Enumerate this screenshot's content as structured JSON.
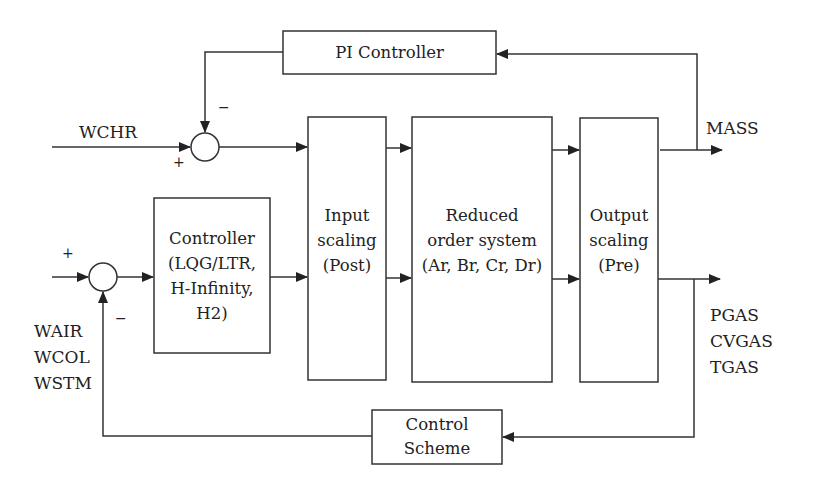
{
  "diagram": {
    "type": "control-block-diagram",
    "blocks": {
      "pi_controller": {
        "label": "PI Controller"
      },
      "controller": {
        "lines": [
          "Controller",
          "(LQG/LTR,",
          "H-Infinity,",
          "H2)"
        ]
      },
      "input_scaling": {
        "lines": [
          "Input",
          "scaling",
          "(Post)"
        ]
      },
      "reduced_order": {
        "lines": [
          "Reduced",
          "order system",
          "(Ar, Br, Cr, Dr)"
        ]
      },
      "output_scaling": {
        "lines": [
          "Output",
          "scaling",
          "(Pre)"
        ]
      },
      "control_scheme": {
        "lines": [
          "Control",
          "Scheme"
        ]
      }
    },
    "signals": {
      "top_input": "WCHR",
      "top_output": "MASS",
      "bottom_inputs": [
        "WAIR",
        "WCOL",
        "WSTM"
      ],
      "bottom_outputs": [
        "PGAS",
        "CVGAS",
        "TGAS"
      ]
    },
    "summing_junctions": {
      "upper": {
        "plus": "+",
        "minus": "−"
      },
      "lower": {
        "plus": "+",
        "minus": "−"
      }
    },
    "colors": {
      "line": "#333333",
      "background": "#ffffff"
    }
  }
}
